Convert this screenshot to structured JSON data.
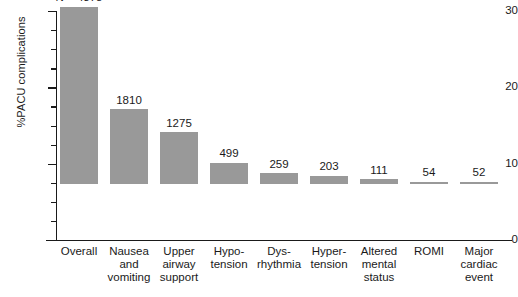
{
  "chart_data": {
    "type": "bar",
    "title": "",
    "xlabel": "",
    "ylabel": "%PACU complications",
    "ylim": [
      0,
      30
    ],
    "ytick_labels": [
      "0",
      "10",
      "20",
      "30"
    ],
    "yticks": [
      0,
      10,
      20,
      30
    ],
    "minor_tick_step": 2.5,
    "grid": false,
    "legend": false,
    "categories": [
      "Overall",
      "Nausea\nand\nvomiting",
      "Upper\nairway\nsupport",
      "Hypo-\ntension",
      "Dys-\nrhythmia",
      "Hyper-\ntension",
      "Altered\nmental\nstatus",
      "ROMI",
      "Major\ncardiac\nevent"
    ],
    "values": [
      23.2,
      9.8,
      6.8,
      2.8,
      1.4,
      1.1,
      0.6,
      0.3,
      0.3
    ],
    "point_labels": [
      "N = 4378",
      "1810",
      "1275",
      "499",
      "259",
      "203",
      "111",
      "54",
      "52"
    ],
    "bar_color": "#999999",
    "axis_color": "#1a1a1a"
  }
}
